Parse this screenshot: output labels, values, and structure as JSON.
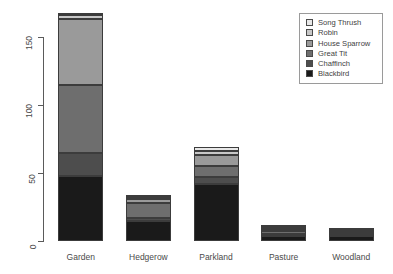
{
  "chart_data": {
    "type": "bar",
    "subtype": "stacked-bar",
    "title": "",
    "xlabel": "",
    "ylabel": "",
    "categories": [
      "Garden",
      "Hedgerow",
      "Parkland",
      "Pasture",
      "Woodland"
    ],
    "ylim": [
      0,
      175
    ],
    "yticks": [
      0,
      50,
      100,
      150
    ],
    "ytick_labels": [
      "0",
      "50",
      "100",
      "150"
    ],
    "grid": false,
    "legend_position": "top-right",
    "stack_order_bottom_to_top": [
      "Blackbird",
      "Chaffinch",
      "Great Tit",
      "House Sparrow",
      "Robin",
      "Song Thrush"
    ],
    "series": [
      {
        "name": "Blackbird",
        "color": "#1a1a1a",
        "values": [
          48,
          15,
          42,
          4,
          4
        ]
      },
      {
        "name": "Chaffinch",
        "color": "#4d4d4d",
        "values": [
          17,
          2,
          5,
          1,
          1
        ]
      },
      {
        "name": "Great Tit",
        "color": "#6e6e6e",
        "values": [
          50,
          11,
          8,
          2,
          1
        ]
      },
      {
        "name": "House Sparrow",
        "color": "#9a9a9a",
        "values": [
          48,
          3,
          8,
          2,
          1
        ]
      },
      {
        "name": "Robin",
        "color": "#c8c8c8",
        "values": [
          3,
          1,
          3,
          1,
          1
        ]
      },
      {
        "name": "Song Thrush",
        "color": "#e8e8e8",
        "values": [
          2,
          1,
          3,
          1,
          1
        ]
      }
    ],
    "totals": [
      168,
      33,
      69,
      11,
      9
    ]
  },
  "legend": {
    "items": [
      {
        "label": "Song Thrush"
      },
      {
        "label": "Robin"
      },
      {
        "label": "House Sparrow"
      },
      {
        "label": "Great Tit"
      },
      {
        "label": "Chaffinch"
      },
      {
        "label": "Blackbird"
      }
    ]
  }
}
